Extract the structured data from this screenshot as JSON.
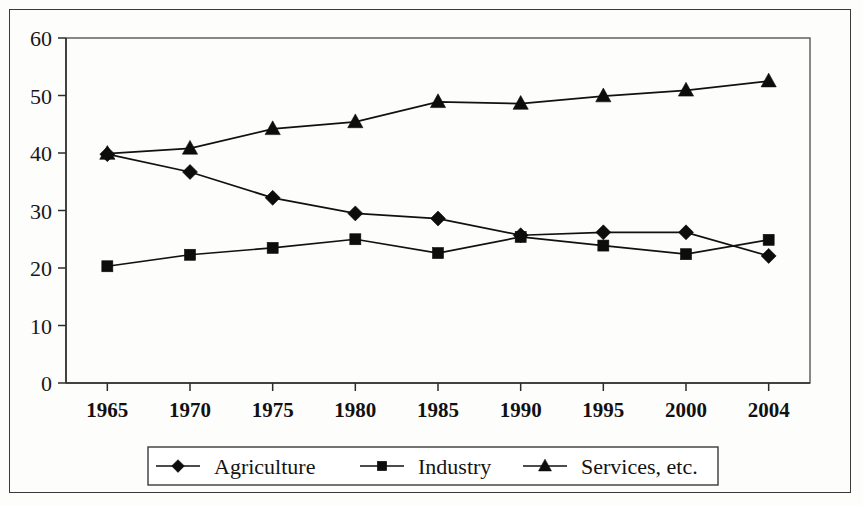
{
  "chart_data": {
    "type": "line",
    "title": "",
    "subtitle": "",
    "xlabel": "",
    "ylabel": "",
    "categories": [
      "1965",
      "1970",
      "1975",
      "1980",
      "1985",
      "1990",
      "1995",
      "2000",
      "2004"
    ],
    "x_tick_labels": [
      "1965",
      "1970",
      "1975",
      "1980",
      "1985",
      "1990",
      "1995",
      "2000",
      "2004"
    ],
    "y_tick_labels": [
      "0",
      "10",
      "20",
      "30",
      "40",
      "50",
      "60"
    ],
    "y_ticks": [
      0,
      10,
      20,
      30,
      40,
      50,
      60
    ],
    "ylim": [
      0,
      60
    ],
    "grid": false,
    "legend_position": "bottom",
    "series": [
      {
        "name": "Agriculture",
        "marker": "diamond",
        "values": [
          39.8,
          36.7,
          32.2,
          29.5,
          28.6,
          25.7,
          26.2,
          26.2,
          22.1
        ]
      },
      {
        "name": "Industry",
        "marker": "square",
        "values": [
          20.3,
          22.3,
          23.5,
          25.0,
          22.6,
          25.4,
          23.9,
          22.4,
          24.9
        ]
      },
      {
        "name": "Services, etc.",
        "marker": "triangle",
        "values": [
          39.9,
          40.8,
          44.2,
          45.4,
          48.9,
          48.6,
          49.9,
          50.9,
          52.5
        ]
      }
    ],
    "colors": {
      "line": "#111111",
      "marker": "#0d0d0d",
      "axis": "#2b2b2b",
      "text": "#131313",
      "background": "#ffffff"
    }
  },
  "legend": {
    "entries": [
      {
        "label": "Agriculture",
        "marker": "diamond"
      },
      {
        "label": "Industry",
        "marker": "square"
      },
      {
        "label": "Services, etc.",
        "marker": "triangle"
      }
    ]
  }
}
